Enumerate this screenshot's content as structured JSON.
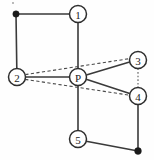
{
  "diagram": {
    "canvas": {
      "width": 154,
      "height": 160,
      "background": "#fefefe"
    },
    "colors": {
      "solid_edge": "#3a3a3a",
      "dashed_edge": "#4a4a4a",
      "dotted_edge": "#5a5a5a",
      "node_stroke": "#2e2e2e",
      "node_fill": "#ffffff",
      "terminal_dot": "#1a1a1a",
      "label_text": "#1c1c1c"
    },
    "nodes": [
      {
        "id": "n1",
        "label": "1",
        "cx": 78,
        "cy": 14,
        "r": 8.5
      },
      {
        "id": "n2",
        "label": "2",
        "cx": 17,
        "cy": 77,
        "r": 8.5
      },
      {
        "id": "nP",
        "label": "P",
        "cx": 78,
        "cy": 77,
        "r": 8.5
      },
      {
        "id": "n3",
        "label": "3",
        "cx": 138,
        "cy": 60,
        "r": 8.5
      },
      {
        "id": "n4",
        "label": "4",
        "cx": 138,
        "cy": 96,
        "r": 8.5
      },
      {
        "id": "n5",
        "label": "5",
        "cx": 78,
        "cy": 139,
        "r": 8.5
      }
    ],
    "terminals": [
      {
        "id": "t_topleft",
        "cx": 16,
        "cy": 14,
        "r": 3.2
      },
      {
        "id": "t_bottomright",
        "cx": 138,
        "cy": 151,
        "r": 3.4
      }
    ],
    "speck": {
      "cx": 13,
      "cy": 3,
      "r": 0.9
    },
    "edges": [
      {
        "id": "e_tl_1",
        "from": "t_topleft",
        "to": "n1",
        "style": "solid",
        "x1": 16,
        "y1": 14,
        "x2": 69.5,
        "y2": 14
      },
      {
        "id": "e_tl_2",
        "from": "t_topleft",
        "to": "n2",
        "style": "solid",
        "x1": 16,
        "y1": 14,
        "x2": 16.8,
        "y2": 68.5
      },
      {
        "id": "e_1_P",
        "from": "n1",
        "to": "nP",
        "style": "solid",
        "x1": 78,
        "y1": 22.5,
        "x2": 78,
        "y2": 68.5
      },
      {
        "id": "e_2_P",
        "from": "n2",
        "to": "nP",
        "style": "solid",
        "x1": 25.5,
        "y1": 77,
        "x2": 69.5,
        "y2": 77
      },
      {
        "id": "e_P_3",
        "from": "nP",
        "to": "n3",
        "style": "solid",
        "x1": 86.3,
        "y1": 75.1,
        "x2": 129.6,
        "y2": 62.0
      },
      {
        "id": "e_P_4",
        "from": "nP",
        "to": "n4",
        "style": "solid",
        "x1": 86.2,
        "y1": 79.3,
        "x2": 129.7,
        "y2": 93.6
      },
      {
        "id": "e_P_5",
        "from": "nP",
        "to": "n5",
        "style": "solid",
        "x1": 78,
        "y1": 85.5,
        "x2": 78,
        "y2": 130.5
      },
      {
        "id": "e_5_br",
        "from": "n5",
        "to": "t_bottomright",
        "style": "solid",
        "x1": 86.2,
        "y1": 141.2,
        "x2": 138,
        "y2": 151
      },
      {
        "id": "e_4_br",
        "from": "n4",
        "to": "t_bottomright",
        "style": "solid",
        "x1": 138,
        "y1": 104.5,
        "x2": 138,
        "y2": 151
      },
      {
        "id": "e_2_3",
        "from": "n2",
        "to": "n3",
        "style": "dashed",
        "x1": 25.3,
        "y1": 74.6,
        "x2": 129.7,
        "y2": 58.6
      },
      {
        "id": "e_2_4",
        "from": "n2",
        "to": "n4",
        "style": "dashed",
        "x1": 25.2,
        "y1": 79.4,
        "x2": 129.7,
        "y2": 95.2
      },
      {
        "id": "e_3_4",
        "from": "n3",
        "to": "n4",
        "style": "dotted",
        "x1": 138,
        "y1": 68.5,
        "x2": 138,
        "y2": 87.5
      }
    ]
  }
}
